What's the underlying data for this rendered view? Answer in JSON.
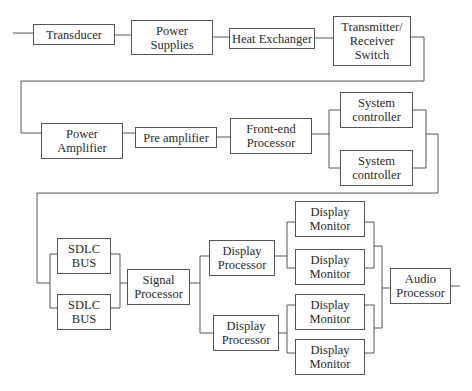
{
  "diagram": {
    "type": "block-diagram",
    "rows": [
      {
        "name": "row-1",
        "blocks": [
          {
            "id": "transducer",
            "label": "Transducer"
          },
          {
            "id": "power-supplies",
            "label": "Power\nSupplies"
          },
          {
            "id": "heat-exchanger",
            "label": "Heat Exchanger"
          },
          {
            "id": "tr-switch",
            "label": "Transmitter/\nReceiver\nSwitch"
          }
        ]
      },
      {
        "name": "row-2",
        "blocks": [
          {
            "id": "power-amplifier",
            "label": "Power\nAmplifier"
          },
          {
            "id": "pre-amplifier",
            "label": "Pre amplifier"
          },
          {
            "id": "front-end-processor",
            "label": "Front-end\nProcessor"
          },
          {
            "id": "system-controller-1",
            "label": "System\ncontroller"
          },
          {
            "id": "system-controller-2",
            "label": "System\ncontroller"
          }
        ]
      },
      {
        "name": "row-3",
        "blocks": [
          {
            "id": "sdlc-bus-1",
            "label": "SDLC\nBUS"
          },
          {
            "id": "sdlc-bus-2",
            "label": "SDLC\nBUS"
          },
          {
            "id": "signal-processor",
            "label": "Signal\nProcessor"
          },
          {
            "id": "display-processor-1",
            "label": "Display\nProcessor"
          },
          {
            "id": "display-processor-2",
            "label": "Display\nProcessor"
          },
          {
            "id": "display-monitor-1",
            "label": "Display\nMonitor"
          },
          {
            "id": "display-monitor-2",
            "label": "Display\nMonitor"
          },
          {
            "id": "display-monitor-3",
            "label": "Display\nMonitor"
          },
          {
            "id": "display-monitor-4",
            "label": "Display\nMonitor"
          },
          {
            "id": "audio-processor",
            "label": "Audio\nProcessor"
          }
        ]
      }
    ],
    "connections": [
      [
        "input",
        "transducer"
      ],
      [
        "transducer",
        "power-supplies"
      ],
      [
        "power-supplies",
        "heat-exchanger"
      ],
      [
        "heat-exchanger",
        "tr-switch"
      ],
      [
        "tr-switch",
        "power-amplifier"
      ],
      [
        "power-amplifier",
        "pre-amplifier"
      ],
      [
        "pre-amplifier",
        "front-end-processor"
      ],
      [
        "front-end-processor",
        "system-controller-1"
      ],
      [
        "front-end-processor",
        "system-controller-2"
      ],
      [
        "system-controller-1",
        "sdlc-bus-1"
      ],
      [
        "system-controller-2",
        "sdlc-bus-2"
      ],
      [
        "sdlc-bus-1",
        "signal-processor"
      ],
      [
        "sdlc-bus-2",
        "signal-processor"
      ],
      [
        "signal-processor",
        "display-processor-1"
      ],
      [
        "signal-processor",
        "display-processor-2"
      ],
      [
        "display-processor-1",
        "display-monitor-1"
      ],
      [
        "display-processor-1",
        "display-monitor-2"
      ],
      [
        "display-processor-2",
        "display-monitor-3"
      ],
      [
        "display-processor-2",
        "display-monitor-4"
      ],
      [
        "display-monitor-1",
        "audio-processor"
      ],
      [
        "display-monitor-2",
        "audio-processor"
      ],
      [
        "display-monitor-3",
        "audio-processor"
      ],
      [
        "display-monitor-4",
        "audio-processor"
      ],
      [
        "audio-processor",
        "output"
      ]
    ]
  }
}
